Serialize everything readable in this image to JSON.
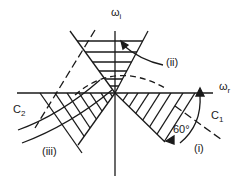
{
  "diagram": {
    "axes": {
      "vertical_label": "ω",
      "vertical_sub": "i",
      "horizontal_label": "ω",
      "horizontal_sub": "r"
    },
    "regions": [
      {
        "id": "i",
        "label": "(i)"
      },
      {
        "id": "ii",
        "label": "(ii)"
      },
      {
        "id": "iii",
        "label": "(iii)"
      }
    ],
    "curves": [
      {
        "id": "C1",
        "label": "C",
        "sub": "1"
      },
      {
        "id": "C2",
        "label": "C",
        "sub": "2"
      }
    ],
    "angle": {
      "label": "60°"
    },
    "colors": {
      "ink": "#1a1a1a",
      "background": "#ffffff"
    }
  }
}
